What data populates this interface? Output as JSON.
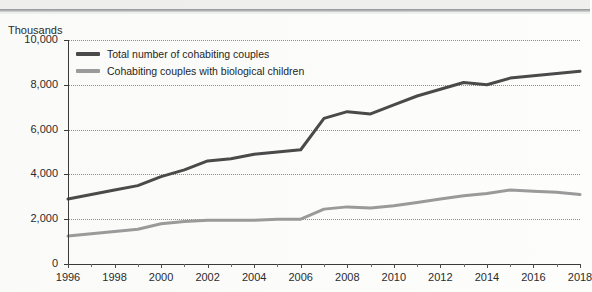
{
  "figure": {
    "y_axis_title": "Thousands",
    "background_color": "#fdfdfc"
  },
  "legend": {
    "position": "top-left-inside",
    "entries": [
      {
        "label": "Total number of cohabiting couples",
        "color": "#4a4a4a"
      },
      {
        "label": "Cohabiting couples with biological children",
        "color": "#9a9a9a"
      }
    ]
  },
  "chart_data": {
    "type": "line",
    "title": "",
    "subtitle": "",
    "xlabel": "",
    "ylabel": "Thousands",
    "xlim": [
      1996,
      2018
    ],
    "ylim": [
      0,
      10000
    ],
    "grid": true,
    "gridline_style": "dotted-horizontal",
    "legend_position": "top-left-inside",
    "y_tick_labels": [
      "0",
      "2,000",
      "4,000",
      "6,000",
      "8,000",
      "10,000"
    ],
    "y_ticks": [
      0,
      2000,
      4000,
      6000,
      8000,
      10000
    ],
    "x_tick_labels": [
      "1996",
      "1998",
      "2000",
      "2002",
      "2004",
      "2006",
      "2008",
      "2010",
      "2012",
      "2014",
      "2016",
      "2018"
    ],
    "x_ticks": [
      1996,
      1998,
      2000,
      2002,
      2004,
      2006,
      2008,
      2010,
      2012,
      2014,
      2016,
      2018
    ],
    "x_minor_ticks": [
      1997,
      1999,
      2001,
      2003,
      2005,
      2007,
      2009,
      2011,
      2013,
      2015,
      2017
    ],
    "x": [
      1996,
      1997,
      1998,
      1999,
      2000,
      2001,
      2002,
      2003,
      2004,
      2005,
      2006,
      2007,
      2008,
      2009,
      2010,
      2011,
      2012,
      2013,
      2014,
      2015,
      2016,
      2017,
      2018
    ],
    "series": [
      {
        "name": "Total number of cohabiting couples",
        "color": "#4a4a4a",
        "width": 3,
        "values": [
          2900,
          3100,
          3300,
          3500,
          3900,
          4200,
          4600,
          4700,
          4900,
          5000,
          5100,
          6500,
          6800,
          6700,
          7100,
          7500,
          7800,
          8100,
          8000,
          8300,
          8400,
          8500,
          8600
        ]
      },
      {
        "name": "Cohabiting couples with biological children",
        "color": "#9a9a9a",
        "width": 3,
        "values": [
          1250,
          1350,
          1450,
          1550,
          1800,
          1900,
          1950,
          1950,
          1950,
          2000,
          2000,
          2450,
          2550,
          2500,
          2600,
          2750,
          2900,
          3050,
          3150,
          3300,
          3250,
          3200,
          3100
        ]
      }
    ]
  }
}
